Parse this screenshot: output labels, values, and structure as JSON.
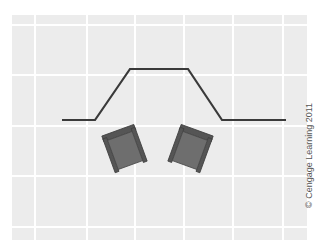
{
  "diagram": {
    "grid": {
      "background": "#ececec",
      "line_color": "#ffffff",
      "vertical_x": [
        35,
        87,
        135,
        184,
        233,
        283
      ],
      "horizontal_y": [
        25,
        75,
        126,
        176,
        227
      ]
    },
    "wall_line": {
      "color": "#3a3a3a",
      "points": "62,120 95,120 130,69 188,69 222,120 286,120"
    },
    "chairs": [
      {
        "name": "left-armchair",
        "cx": 125,
        "cy": 150,
        "rotation": -20
      },
      {
        "name": "right-armchair",
        "cx": 190,
        "cy": 150,
        "rotation": 20
      }
    ],
    "chair_colors": {
      "frame": "#555555",
      "seat": "#6e6e6e"
    },
    "credit": "© Cengage Learning 2011"
  }
}
